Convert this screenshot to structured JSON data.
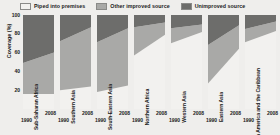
{
  "legend": {
    "position": "top",
    "items": [
      {
        "label": "Piped into premises",
        "color": "#f2f1ef",
        "key": "piped"
      },
      {
        "label": "Other improved source",
        "color": "#a9a9a7",
        "key": "other_improved"
      },
      {
        "label": "Unimproved source",
        "color": "#6d6d6b",
        "key": "unimproved"
      }
    ]
  },
  "axes": {
    "ylabel": "Coverage (%)",
    "yticks": [
      "100",
      "80",
      "60",
      "40",
      "20"
    ],
    "ymin": 0,
    "ymax": 100,
    "xticks": [
      "1990",
      "2008"
    ]
  },
  "chart_data": {
    "type": "area",
    "title": "",
    "subtitle": "",
    "xlabel": "",
    "ylabel": "Coverage (%)",
    "ylim": [
      0,
      100
    ],
    "grid": false,
    "legend_position": "top",
    "x": [
      "1990",
      "2008"
    ],
    "panels": [
      {
        "region": "Sub-Saharan Africa",
        "series": [
          {
            "name": "Piped into premises",
            "values": [
              16,
              16
            ]
          },
          {
            "name": "Other improved source",
            "values": [
              33,
              44
            ]
          },
          {
            "name": "Unimproved source",
            "values": [
              51,
              40
            ]
          }
        ]
      },
      {
        "region": "Southern Asia",
        "series": [
          {
            "name": "Piped into premises",
            "values": [
              20,
              24
            ]
          },
          {
            "name": "Other improved source",
            "values": [
              52,
              63
            ]
          },
          {
            "name": "Unimproved source",
            "values": [
              28,
              13
            ]
          }
        ]
      },
      {
        "region": "South-Eastern Asia",
        "series": [
          {
            "name": "Piped into premises",
            "values": [
              18,
              25
            ]
          },
          {
            "name": "Other improved source",
            "values": [
              53,
              61
            ]
          },
          {
            "name": "Unimproved source",
            "values": [
              29,
              14
            ]
          }
        ]
      },
      {
        "region": "Northern Africa",
        "series": [
          {
            "name": "Piped into premises",
            "values": [
              57,
              79
            ]
          },
          {
            "name": "Other improved source",
            "values": [
              30,
              13
            ]
          },
          {
            "name": "Unimproved source",
            "values": [
              13,
              8
            ]
          }
        ]
      },
      {
        "region": "Western Asia",
        "series": [
          {
            "name": "Piped into premises",
            "values": [
              70,
              82
            ]
          },
          {
            "name": "Other improved source",
            "values": [
              16,
              8
            ]
          },
          {
            "name": "Unimproved source",
            "values": [
              14,
              10
            ]
          }
        ]
      },
      {
        "region": "Eastern Asia",
        "series": [
          {
            "name": "Piped into premises",
            "values": [
              27,
              64
            ]
          },
          {
            "name": "Other improved source",
            "values": [
              41,
              25
            ]
          },
          {
            "name": "Unimproved source",
            "values": [
              32,
              11
            ]
          }
        ]
      },
      {
        "region": "Latin America and the Caribbean",
        "series": [
          {
            "name": "Piped into premises",
            "values": [
              71,
              83
            ]
          },
          {
            "name": "Other improved source",
            "values": [
              14,
              10
            ]
          },
          {
            "name": "Unimproved source",
            "values": [
              15,
              7
            ]
          }
        ]
      }
    ]
  },
  "colors": {
    "piped": "#f2f1ef",
    "other_improved": "#a9a9a7",
    "unimproved": "#6d6d6b",
    "background": "#efeeec",
    "panel_bg": "#f7f6f4",
    "text": "#1a1a1a"
  }
}
